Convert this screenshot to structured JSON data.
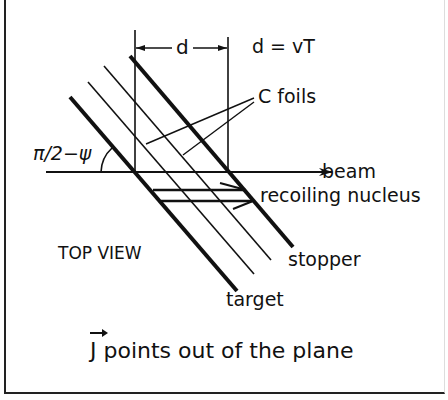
{
  "diagram": {
    "view_label": "TOP VIEW",
    "labels": {
      "d": "d",
      "d_equation": "d = vT",
      "c_foils": "C foils",
      "angle": "π/2−ψ",
      "beam": "beam",
      "recoiling_nucleus": "recoiling nucleus",
      "stopper": "stopper",
      "target": "target"
    },
    "caption": {
      "vector_symbol": "J",
      "text": " points out of the plane"
    },
    "elements": [
      "target",
      "C foil 1",
      "C foil 2",
      "stopper",
      "beam arrow",
      "recoiling nucleus arrows",
      "dimension d"
    ],
    "colors": {
      "ink": "#111111",
      "background": "#ffffff"
    }
  }
}
